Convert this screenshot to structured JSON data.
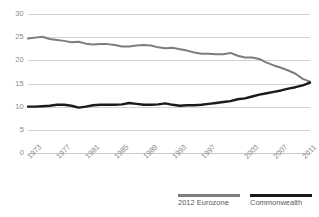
{
  "chart_data": {
    "type": "line",
    "title": "",
    "xlabel": "",
    "ylabel": "",
    "ylim": [
      0,
      30
    ],
    "yticks": [
      0,
      5,
      10,
      15,
      20,
      25,
      30
    ],
    "xlim": [
      1973,
      2012
    ],
    "xticks": [
      1973,
      1977,
      1981,
      1985,
      1989,
      1993,
      1997,
      2003,
      2007,
      2011
    ],
    "xtick_labels": [
      "1973",
      "1977",
      "1981",
      "1985",
      "1989",
      "1993",
      "1997",
      "2003",
      "2007",
      "2011"
    ],
    "grid": true,
    "grid_axis": "y",
    "legend_position": "bottom-right",
    "x": [
      1973,
      1974,
      1975,
      1976,
      1977,
      1978,
      1979,
      1980,
      1981,
      1982,
      1983,
      1984,
      1985,
      1986,
      1987,
      1988,
      1989,
      1990,
      1991,
      1992,
      1993,
      1994,
      1995,
      1996,
      1997,
      1998,
      1999,
      2000,
      2001,
      2002,
      2003,
      2004,
      2005,
      2006,
      2007,
      2008,
      2009,
      2010,
      2011,
      2012
    ],
    "series": [
      {
        "name": "2012 Eurozone",
        "color": "#7d7d7d",
        "values": [
          24.7,
          24.9,
          25.1,
          24.6,
          24.4,
          24.2,
          23.9,
          24.0,
          23.6,
          23.4,
          23.5,
          23.5,
          23.3,
          23.0,
          23.0,
          23.2,
          23.3,
          23.2,
          22.8,
          22.6,
          22.7,
          22.4,
          22.1,
          21.7,
          21.4,
          21.4,
          21.3,
          21.3,
          21.6,
          21.0,
          20.6,
          20.6,
          20.3,
          19.5,
          18.9,
          18.4,
          17.8,
          17.1,
          16.0,
          15.4
        ]
      },
      {
        "name": "Commonwealth",
        "color": "#1a1a1a",
        "values": [
          10.0,
          10.0,
          10.1,
          10.2,
          10.4,
          10.4,
          10.2,
          9.8,
          10.0,
          10.3,
          10.4,
          10.4,
          10.4,
          10.5,
          10.8,
          10.6,
          10.4,
          10.4,
          10.5,
          10.7,
          10.4,
          10.2,
          10.3,
          10.3,
          10.4,
          10.6,
          10.8,
          11.0,
          11.2,
          11.6,
          11.8,
          12.2,
          12.6,
          12.9,
          13.2,
          13.5,
          13.9,
          14.2,
          14.6,
          15.2
        ]
      }
    ]
  },
  "legend": {
    "items": [
      {
        "label": "2012 Eurozone",
        "swatch": "eurozone-line-swatch"
      },
      {
        "label": "Commonwealth",
        "swatch": "commonwealth-line-swatch"
      }
    ]
  },
  "colors": {
    "eurozone": "#7d7d7d",
    "commonwealth": "#1a1a1a",
    "gridline": "#d2d2d2",
    "tick_text": "#8a8a8a",
    "legend_text": "#595959",
    "background": "#ffffff"
  }
}
